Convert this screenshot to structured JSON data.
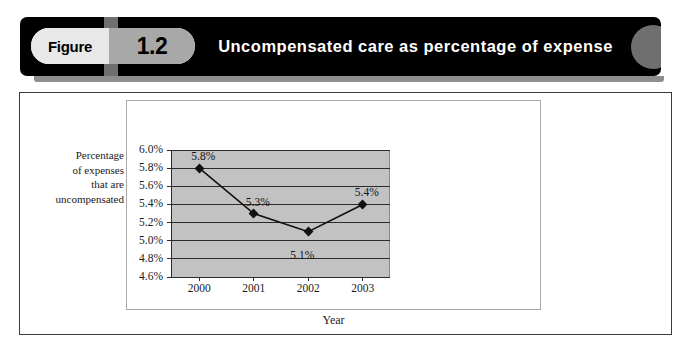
{
  "banner": {
    "figure_word": "Figure",
    "figure_number": "1.2",
    "title": "Uncompensated care as percentage of expense"
  },
  "chart_data": {
    "type": "line",
    "title": "Uncompensated care as percentage of expense",
    "xlabel": "Year",
    "ylabel": "Percentage of expenses that are uncompensated",
    "ylabel_lines": [
      "Percentage",
      "of expenses",
      "that are",
      "uncompensated"
    ],
    "categories": [
      "2000",
      "2001",
      "2002",
      "2003"
    ],
    "values": [
      5.8,
      5.3,
      5.1,
      5.4
    ],
    "point_labels": [
      "5.8%",
      "5.3%",
      "5.1%",
      "5.4%"
    ],
    "label_positions": [
      "above",
      "above",
      "below",
      "above"
    ],
    "ylim": [
      4.6,
      6.0
    ],
    "ystep": 0.2,
    "ytick_labels": [
      "6.0%",
      "5.8%",
      "5.6%",
      "5.4%",
      "5.2%",
      "5.0%",
      "4.8%",
      "4.6%"
    ],
    "ytick_values": [
      6.0,
      5.8,
      5.6,
      5.4,
      5.2,
      5.0,
      4.8,
      4.6
    ],
    "grid": true,
    "legend": "none",
    "plot_background": "#c2c2c2",
    "series_color": "#111111",
    "marker": "diamond"
  }
}
